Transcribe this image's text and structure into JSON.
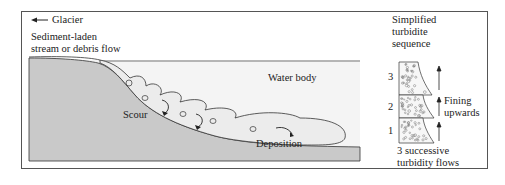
{
  "diagram": {
    "labels": {
      "glacier": "Glacier",
      "source_line1": "Sediment-laden",
      "source_line2": "stream or debris flow",
      "water_body": "Water body",
      "scour": "Scour",
      "deposition": "Deposition",
      "sequence_line1": "Simplified",
      "sequence_line2": "turbidite",
      "sequence_line3": "sequence",
      "fining_line1": "Fining",
      "fining_line2": "upwards",
      "flows_line1": "3 successive",
      "flows_line2": "turbidity flows"
    },
    "sequence_layers": [
      "3",
      "2",
      "1"
    ],
    "colors": {
      "ground": "#c8c8c8",
      "water": "#f2f2f2",
      "line": "#333333"
    }
  }
}
